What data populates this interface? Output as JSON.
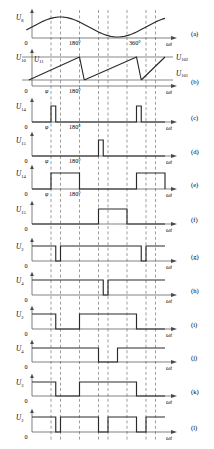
{
  "figure": {
    "width": 214,
    "height": 449,
    "axis_x_label": "ωt",
    "zero_label": "0",
    "ink_color": "#2a2a2a",
    "grid_color": "#6b6b6b"
  },
  "gridlines": {
    "description": "vertical dashed reference lines shared by all panels",
    "phase_labels": [
      "φ",
      "180°",
      "360°"
    ],
    "x_positions": [
      47,
      57,
      77,
      97,
      107,
      127,
      147,
      157
    ]
  },
  "panels": [
    {
      "id": "(a)",
      "y_label": "U",
      "y_sub": "8",
      "type": "sine",
      "x_ticks": [
        {
          "text": "180°",
          "x": 77
        },
        {
          "text": "360°",
          "x": 137
        }
      ]
    },
    {
      "id": "(b)",
      "y_label": "U",
      "y_sub": "10",
      "type": "sawtooth",
      "extra_left_label": {
        "text": "U",
        "sub": "11"
      },
      "right_labels": [
        {
          "text": "U",
          "sub": "102"
        },
        {
          "text": "U",
          "sub": "101"
        }
      ],
      "x_ticks": [
        {
          "text": "φ",
          "x": 47,
          "italic": true
        },
        {
          "text": "180°",
          "x": 77
        }
      ]
    },
    {
      "id": "(c)",
      "y_label": "U",
      "y_sub": "14",
      "type": "narrow-pulse",
      "x_ticks": [
        {
          "text": "φ",
          "x": 47,
          "italic": true
        },
        {
          "text": "180°",
          "x": 77
        }
      ]
    },
    {
      "id": "(d)",
      "y_label": "U",
      "y_sub": "15",
      "type": "narrow-pulse",
      "x_ticks": [
        {
          "text": "φ",
          "x": 47,
          "italic": true
        },
        {
          "text": "180°",
          "x": 77
        }
      ]
    },
    {
      "id": "(e)",
      "y_label": "U",
      "y_sub": "14",
      "type": "wide-pulse",
      "x_ticks": [
        {
          "text": "φ",
          "x": 47,
          "italic": true
        },
        {
          "text": "180°",
          "x": 77
        }
      ]
    },
    {
      "id": "(f)",
      "y_label": "U",
      "y_sub": "15",
      "type": "wide-pulse",
      "x_ticks": []
    },
    {
      "id": "(g)",
      "y_label": "U",
      "y_sub": "2",
      "type": "logic",
      "x_ticks": []
    },
    {
      "id": "(h)",
      "y_label": "U",
      "y_sub": "4",
      "type": "logic",
      "x_ticks": []
    },
    {
      "id": "(i)",
      "y_label": "U",
      "y_sub": "2",
      "type": "logic",
      "x_ticks": []
    },
    {
      "id": "(j)",
      "y_label": "U",
      "y_sub": "4",
      "type": "logic",
      "x_ticks": []
    },
    {
      "id": "(k)",
      "y_label": "U",
      "y_sub": "3",
      "type": "logic",
      "x_ticks": []
    },
    {
      "id": "(l)",
      "y_label": "U",
      "y_sub": "2",
      "type": "logic",
      "x_ticks": []
    }
  ],
  "chart_data": {
    "type": "line",
    "xlabel": "ωt",
    "ylabel": "",
    "grid": true,
    "legend_position": "right",
    "x_axis": {
      "unit": "degrees",
      "range": [
        0,
        420
      ],
      "tick_values": [
        180,
        360
      ],
      "tick_labels": [
        "180°",
        "360°"
      ],
      "phase_marker": {
        "label": "φ",
        "value": 60
      }
    },
    "vertical_gridlines_deg": [
      60,
      90,
      150,
      210,
      240,
      300,
      360,
      390
    ],
    "series": [
      {
        "name": "U8",
        "panel": "(a)",
        "kind": "sine",
        "amplitude": 1,
        "period_deg": 360,
        "phase_deg": 0,
        "description": "synchronising sine wave, zero crossings at 0, 180, 360"
      },
      {
        "name": "U10",
        "panel": "(b)",
        "kind": "sawtooth",
        "description": "ramp rising to U102 then falling to U101 baseline",
        "reference_levels": [
          {
            "name": "U102",
            "value": 1.0
          },
          {
            "name": "U101",
            "value": 0.22
          }
        ],
        "ramp_segments_deg": [
          [
            -10,
            150
          ],
          [
            165,
            330
          ],
          [
            345,
            420
          ]
        ],
        "reset_segments_deg": [
          [
            150,
            165
          ],
          [
            330,
            345
          ]
        ]
      },
      {
        "name": "U14",
        "panel": "(c)",
        "kind": "pulse",
        "level_high": 1,
        "level_low": 0,
        "pulses_deg": [
          [
            60,
            75
          ],
          [
            330,
            345
          ]
        ]
      },
      {
        "name": "U15",
        "panel": "(d)",
        "kind": "pulse",
        "level_high": 1,
        "level_low": 0,
        "pulses_deg": [
          [
            210,
            225
          ]
        ]
      },
      {
        "name": "U14",
        "panel": "(e)",
        "kind": "pulse",
        "level_high": 1,
        "level_low": 0,
        "pulses_deg": [
          [
            60,
            150
          ],
          [
            330,
            420
          ]
        ]
      },
      {
        "name": "U15",
        "panel": "(f)",
        "kind": "pulse",
        "level_high": 1,
        "level_low": 0,
        "pulses_deg": [
          [
            210,
            300
          ]
        ]
      },
      {
        "name": "U2",
        "panel": "(g)",
        "kind": "logic",
        "level_high": 1,
        "level_low": 0,
        "initial": 1,
        "low_segments_deg": [
          [
            75,
            90
          ],
          [
            345,
            360
          ]
        ]
      },
      {
        "name": "U4",
        "panel": "(h)",
        "kind": "logic",
        "level_high": 1,
        "level_low": 0,
        "initial": 1,
        "low_segments_deg": [
          [
            225,
            240
          ]
        ]
      },
      {
        "name": "U2",
        "panel": "(i)",
        "kind": "logic",
        "level_high": 1,
        "level_low": 0,
        "initial": 1,
        "high_segments_deg": [
          [
            0,
            75
          ],
          [
            150,
            330
          ]
        ]
      },
      {
        "name": "U4",
        "panel": "(j)",
        "kind": "logic",
        "level_high": 1,
        "level_low": 0,
        "initial": 1,
        "high_segments_deg": [
          [
            0,
            210
          ],
          [
            270,
            420
          ]
        ]
      },
      {
        "name": "U3",
        "panel": "(k)",
        "kind": "logic",
        "level_high": 1,
        "level_low": 0,
        "initial": 1,
        "high_segments_deg": [
          [
            0,
            75
          ],
          [
            150,
            330
          ]
        ]
      },
      {
        "name": "U2",
        "panel": "(l)",
        "kind": "logic",
        "level_high": 1,
        "level_low": 0,
        "initial": 1,
        "high_segments_deg": [
          [
            0,
            75
          ],
          [
            90,
            210
          ],
          [
            240,
            330
          ],
          [
            360,
            420
          ]
        ]
      }
    ]
  }
}
